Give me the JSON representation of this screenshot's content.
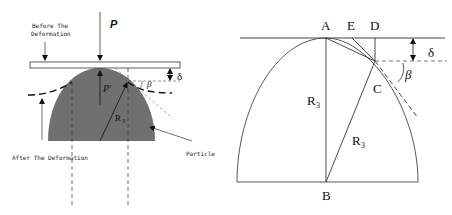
{
  "left_figure": {
    "force_label": "P",
    "reaction_label": "P'",
    "radius_label": "R",
    "radius_subscript": "3",
    "delta_label": "δ",
    "beta_label": "β",
    "before_label_line1": "Before The",
    "before_label_line2": "Deformation",
    "after_label": "After The Deformation",
    "particle_label": "Particle",
    "particle_color": "#707070"
  },
  "right_figure": {
    "point_a": "A",
    "point_b": "B",
    "point_c": "C",
    "point_d": "D",
    "point_e": "E",
    "radius_label_1": "R",
    "radius_subscript_1": "3",
    "radius_label_2": "R",
    "radius_subscript_2": "3",
    "delta_label": "δ",
    "beta_label": "β"
  }
}
